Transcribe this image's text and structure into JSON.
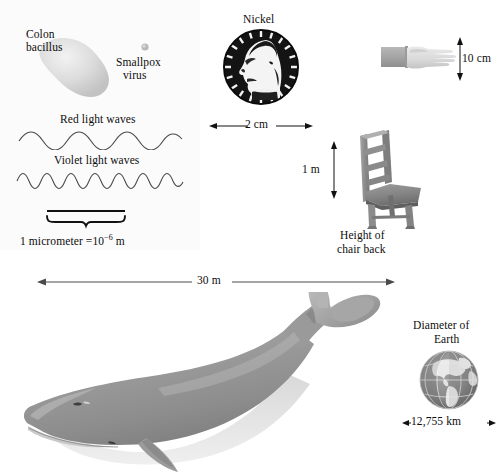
{
  "figure": {
    "background_color": "#ffffff",
    "panel_tint_color": "#fbfbfb",
    "ink_color": "#111111"
  },
  "items": {
    "colon_bacillus": {
      "label_line1": "Colon",
      "label_line2": "bacillus",
      "icon": "bacillus-blob",
      "fill_color": "#dcdcdc"
    },
    "smallpox_virus": {
      "label_line1": "Smallpox",
      "label_line2": "virus",
      "icon": "virus-dot",
      "fill_color": "#b9b9b9"
    },
    "red_light": {
      "label": "Red light waves",
      "icon": "sine-wave",
      "cycles": 5,
      "stroke_color": "#4a4a4a"
    },
    "violet_light": {
      "label": "Violet light waves",
      "icon": "sine-wave",
      "cycles": 10,
      "stroke_color": "#4a4a4a"
    },
    "micrometer_scale": {
      "label": "1 micrometer =10",
      "exponent": "−6",
      "label_suffix": " m",
      "icon": "brace-scale-bar"
    },
    "nickel": {
      "label": "Nickel",
      "icon": "nickel-coin",
      "dimension": "2 cm",
      "dimension_axis": "horizontal",
      "fill_color": "#141414"
    },
    "hand": {
      "label": "",
      "icon": "hand-with-sleeve",
      "dimension": "10 cm",
      "dimension_axis": "vertical",
      "hand_color": "#dadada",
      "sleeve_color": "#a8a8a8"
    },
    "chair": {
      "label_line1": "Height of",
      "label_line2": "chair back",
      "icon": "ladder-back-chair",
      "dimension": "1 m",
      "dimension_axis": "vertical",
      "fill_color": "#8d8d8d"
    },
    "whale": {
      "label": "",
      "icon": "blue-whale",
      "dimension": "30 m",
      "dimension_axis": "horizontal",
      "body_color": "#9a9a9a",
      "belly_color": "#d7d7d7"
    },
    "earth": {
      "label_line1": "Diameter of",
      "label_line2": "Earth",
      "icon": "earth-globe",
      "dimension": "12,755 km",
      "dimension_axis": "horizontal",
      "ocean_color": "#8c8c8c",
      "land_color": "#e8e8e8"
    }
  }
}
